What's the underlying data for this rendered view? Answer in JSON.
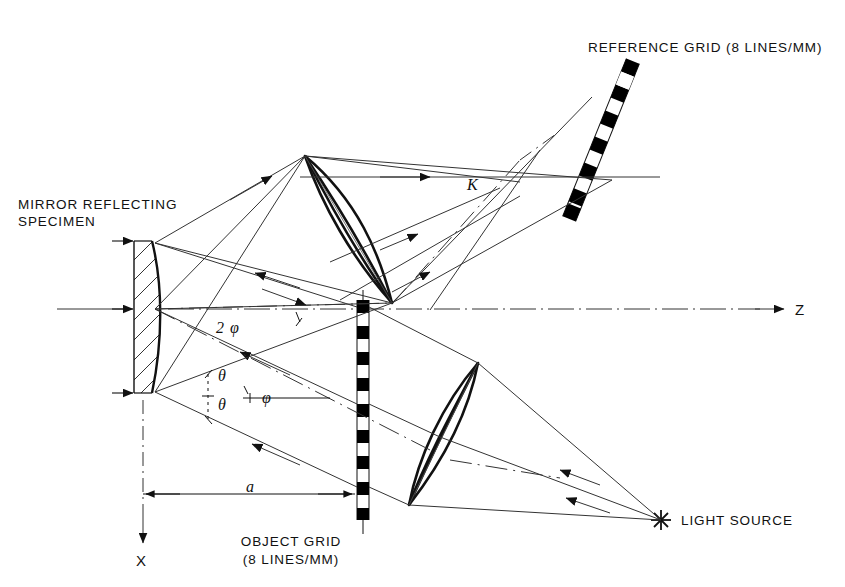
{
  "figure": {
    "background_color": "#ffffff",
    "line_color": "#1a1a1a",
    "grid_dark_color": "#000000",
    "grid_light_color": "#ffffff"
  },
  "labels": {
    "reference_grid": "REFERENCE  GRID (8 LINES/MM)",
    "mirror_line1": "MIRROR  REFLECTING",
    "mirror_line2": "SPECIMEN",
    "object_grid_line1": "OBJECT  GRID",
    "object_grid_line2": "(8 LINES/MM)",
    "light_source": "LIGHT  SOURCE",
    "axis_z": "Z",
    "axis_x": "X",
    "distance_a": "a",
    "angle_two_phi": "2",
    "angle_two_phi_sym": "φ",
    "angle_theta_upper": "θ",
    "angle_theta_lower": "θ",
    "angle_phi": "φ",
    "point_k": "K"
  },
  "components": [
    {
      "name": "mirror-reflecting-specimen",
      "type": "concave-mirror",
      "hatched": true
    },
    {
      "name": "object-grid",
      "type": "linear-grating",
      "orientation": "vertical",
      "lines_per_mm": 8
    },
    {
      "name": "reference-grid",
      "type": "linear-grating",
      "orientation": "tilted",
      "lines_per_mm": 8
    },
    {
      "name": "lower-lens",
      "type": "biconvex-lens"
    },
    {
      "name": "upper-lens",
      "type": "biconvex-lens"
    },
    {
      "name": "light-source",
      "type": "point-source"
    }
  ],
  "axes": {
    "z_label": "Z",
    "x_label": "X",
    "z_direction": "horizontal-right",
    "x_direction": "vertical-down"
  }
}
